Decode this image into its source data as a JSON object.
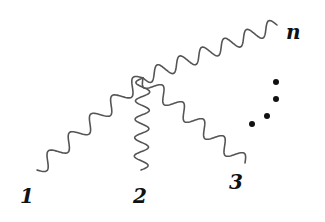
{
  "diagram": {
    "type": "feynman-vertex",
    "vertex": {
      "x": 143,
      "y": 78
    },
    "colors": {
      "line": "#555555",
      "text": "#111111",
      "background": "#ffffff"
    },
    "lines": [
      {
        "id": "1",
        "label": "1",
        "end": {
          "x": 37,
          "y": 170
        },
        "waves": 5
      },
      {
        "id": "2",
        "label": "2",
        "end": {
          "x": 141,
          "y": 170
        },
        "waves": 5
      },
      {
        "id": "3",
        "label": "3",
        "end": {
          "x": 245,
          "y": 163
        },
        "waves": 5
      },
      {
        "id": "n",
        "label": "n",
        "end": {
          "x": 277,
          "y": 25
        },
        "waves": 6
      }
    ],
    "labels": [
      {
        "text": "1",
        "x": 20,
        "y": 186
      },
      {
        "text": "2",
        "x": 133,
        "y": 186
      },
      {
        "text": "3",
        "x": 229,
        "y": 172
      },
      {
        "text": "n",
        "x": 286,
        "y": 22
      }
    ],
    "ellipsis_dots": [
      {
        "x": 276,
        "y": 82
      },
      {
        "x": 276,
        "y": 99
      },
      {
        "x": 267,
        "y": 116
      },
      {
        "x": 252,
        "y": 124
      }
    ]
  }
}
